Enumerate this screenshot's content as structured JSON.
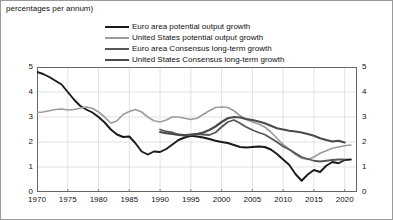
{
  "chart_data": {
    "type": "line",
    "title": "percentages per annum)",
    "xlabel": "",
    "ylabel": "",
    "xlim": [
      1970,
      2022
    ],
    "ylim": [
      0,
      5
    ],
    "grid": true,
    "legend_position": "top-center",
    "y_ticks": [
      0,
      1,
      2,
      3,
      4,
      5
    ],
    "y_ticks_right": [
      0,
      1,
      2,
      3,
      4,
      5
    ],
    "x_ticks": [
      1970,
      1975,
      1980,
      1985,
      1990,
      1995,
      2000,
      2005,
      2010,
      2015,
      2020
    ],
    "series": [
      {
        "name": "Euro area potential output growth",
        "color": "#1a1a1a",
        "width": 1.9,
        "x": [
          1970,
          1971,
          1972,
          1973,
          1974,
          1975,
          1976,
          1977,
          1978,
          1979,
          1980,
          1981,
          1982,
          1983,
          1984,
          1985,
          1986,
          1987,
          1988,
          1989,
          1990,
          1991,
          1992,
          1993,
          1994,
          1995,
          1996,
          1997,
          1998,
          1999,
          2000,
          2001,
          2002,
          2003,
          2004,
          2005,
          2006,
          2007,
          2008,
          2009,
          2010,
          2011,
          2012,
          2013,
          2014,
          2015,
          2016,
          2017,
          2018,
          2019,
          2020,
          2021
        ],
        "values": [
          4.8,
          4.72,
          4.6,
          4.45,
          4.3,
          4.0,
          3.7,
          3.45,
          3.3,
          3.18,
          3.0,
          2.78,
          2.5,
          2.3,
          2.2,
          2.22,
          1.95,
          1.62,
          1.5,
          1.62,
          1.6,
          1.72,
          1.9,
          2.08,
          2.18,
          2.25,
          2.22,
          2.18,
          2.12,
          2.05,
          2.0,
          1.96,
          1.88,
          1.8,
          1.78,
          1.8,
          1.82,
          1.8,
          1.7,
          1.52,
          1.3,
          1.08,
          0.72,
          0.45,
          0.7,
          0.88,
          0.8,
          1.05,
          1.2,
          1.15,
          1.28,
          1.3
        ]
      },
      {
        "name": "United States potential output growth",
        "color": "#9d9d9d",
        "width": 1.7,
        "x": [
          1970,
          1971,
          1972,
          1973,
          1974,
          1975,
          1976,
          1977,
          1978,
          1979,
          1980,
          1981,
          1982,
          1983,
          1984,
          1985,
          1986,
          1987,
          1988,
          1989,
          1990,
          1991,
          1992,
          1993,
          1994,
          1995,
          1996,
          1997,
          1998,
          1999,
          2000,
          2001,
          2002,
          2003,
          2004,
          2005,
          2006,
          2007,
          2008,
          2009,
          2010,
          2011,
          2012,
          2013,
          2014,
          2015,
          2016,
          2017,
          2018,
          2019,
          2020,
          2021
        ],
        "values": [
          3.18,
          3.2,
          3.25,
          3.3,
          3.32,
          3.28,
          3.3,
          3.35,
          3.4,
          3.35,
          3.2,
          3.0,
          2.75,
          2.85,
          3.1,
          3.22,
          3.3,
          3.2,
          3.0,
          2.85,
          2.8,
          2.88,
          3.0,
          3.0,
          2.95,
          2.9,
          2.95,
          3.1,
          3.25,
          3.38,
          3.4,
          3.38,
          3.25,
          3.05,
          2.9,
          2.8,
          2.72,
          2.6,
          2.4,
          2.15,
          1.9,
          1.7,
          1.5,
          1.35,
          1.3,
          1.4,
          1.55,
          1.65,
          1.75,
          1.8,
          1.85,
          1.88
        ]
      },
      {
        "name": "Euro area Consensus long-term growth",
        "color": "#565656",
        "width": 1.8,
        "x": [
          1990,
          1991,
          1992,
          1993,
          1994,
          1995,
          1996,
          1997,
          1998,
          1999,
          2000,
          2001,
          2002,
          2003,
          2004,
          2005,
          2006,
          2007,
          2008,
          2009,
          2010,
          2011,
          2012,
          2013,
          2014,
          2015,
          2016,
          2017,
          2018,
          2019,
          2020
        ],
        "values": [
          2.5,
          2.42,
          2.38,
          2.3,
          2.28,
          2.3,
          2.32,
          2.3,
          2.28,
          2.38,
          2.6,
          2.8,
          2.88,
          2.75,
          2.6,
          2.48,
          2.38,
          2.3,
          2.15,
          2.0,
          1.82,
          1.7,
          1.55,
          1.4,
          1.32,
          1.25,
          1.22,
          1.25,
          1.28,
          1.3,
          1.3
        ]
      },
      {
        "name": "United States Consensus long-term growth",
        "color": "#4a4a4a",
        "width": 2.2,
        "x": [
          1990,
          1991,
          1992,
          1993,
          1994,
          1995,
          1996,
          1997,
          1998,
          1999,
          2000,
          2001,
          2002,
          2003,
          2004,
          2005,
          2006,
          2007,
          2008,
          2009,
          2010,
          2011,
          2012,
          2013,
          2014,
          2015,
          2016,
          2017,
          2018,
          2019,
          2020
        ],
        "values": [
          2.4,
          2.35,
          2.32,
          2.28,
          2.26,
          2.28,
          2.32,
          2.38,
          2.48,
          2.62,
          2.8,
          2.95,
          3.0,
          2.98,
          2.92,
          2.88,
          2.82,
          2.75,
          2.65,
          2.55,
          2.5,
          2.45,
          2.42,
          2.38,
          2.32,
          2.25,
          2.15,
          2.08,
          2.02,
          2.05,
          1.98
        ]
      }
    ]
  },
  "legend": {
    "items": [
      {
        "label": "Euro area potential output growth",
        "color": "#1a1a1a"
      },
      {
        "label": "United States potential output growth",
        "color": "#9d9d9d"
      },
      {
        "label": "Euro area Consensus long-term growth",
        "color": "#565656"
      },
      {
        "label": "United States Consensus long-term growth",
        "color": "#4a4a4a"
      }
    ]
  }
}
